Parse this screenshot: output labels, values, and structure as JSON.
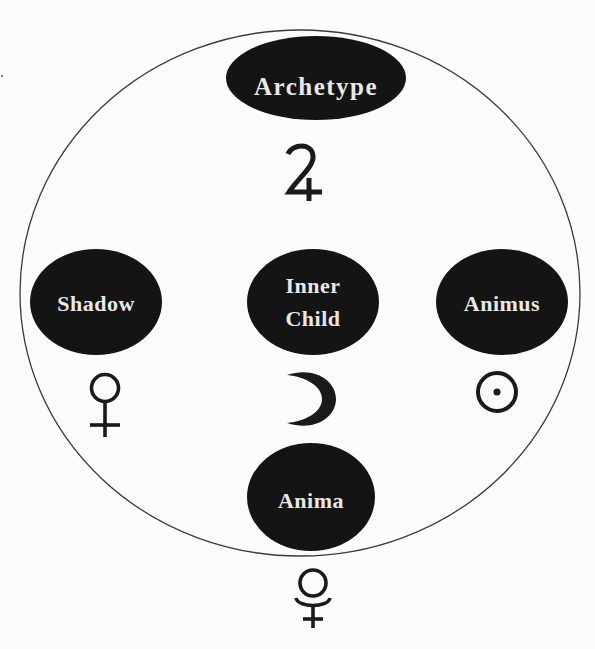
{
  "diagram": {
    "type": "archetype-symbol-map",
    "colors": {
      "background": "#fbfbfa",
      "node_fill": "#141414",
      "node_text": "#e8e8e8",
      "outline": "#3a3a3a",
      "symbol": "#1a1a1a"
    },
    "outer_circle": {
      "cx": 300,
      "cy": 293,
      "rx": 280,
      "ry": 263
    },
    "nodes": [
      {
        "id": "archetype",
        "label": "Archetype",
        "cx": 316,
        "cy": 78,
        "rx": 90,
        "ry": 42,
        "font_size": 25,
        "symbol": "jupiter-icon",
        "symbol_glyph": "♃"
      },
      {
        "id": "shadow",
        "label": "Shadow",
        "cx": 96,
        "cy": 302,
        "rx": 66,
        "ry": 53,
        "font_size": 22,
        "symbol": "venus-icon",
        "symbol_glyph": "♀"
      },
      {
        "id": "inner-child",
        "label_lines": [
          "Inner",
          "Child"
        ],
        "cx": 313,
        "cy": 302,
        "rx": 66,
        "ry": 53,
        "font_size": 22,
        "symbol": "moon-crescent-icon",
        "symbol_glyph": "☽"
      },
      {
        "id": "animus",
        "label": "Animus",
        "cx": 502,
        "cy": 302,
        "rx": 66,
        "ry": 53,
        "font_size": 22,
        "symbol": "sun-icon",
        "symbol_glyph": "☉"
      },
      {
        "id": "anima",
        "label": "Anima",
        "cx": 311,
        "cy": 497,
        "rx": 64,
        "ry": 54,
        "font_size": 22,
        "symbol": "pluto-icon",
        "symbol_glyph": "⯓"
      }
    ]
  }
}
